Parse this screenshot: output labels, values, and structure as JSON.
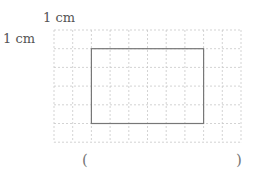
{
  "question": {
    "unit_label_horizontal": "1 cm",
    "unit_label_vertical": "1 cm",
    "grid": {
      "columns": 10,
      "rows": 6,
      "cell_size_cm": 1
    },
    "rectangle": {
      "start_col": 2,
      "start_row": 1,
      "width_cells": 6,
      "height_cells": 4
    },
    "answer_open": "(",
    "answer_value": "",
    "answer_close": ")"
  },
  "colors": {
    "grid_line": "#c8c8c8",
    "rectangle_stroke": "#777777"
  }
}
